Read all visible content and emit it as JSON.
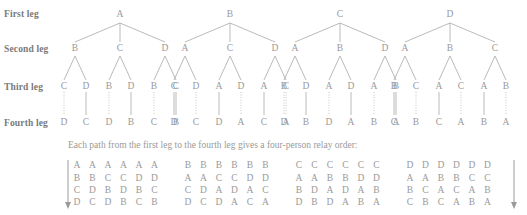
{
  "figure": {
    "row_labels": [
      "First leg",
      "Second leg",
      "Third leg",
      "Fourth leg"
    ],
    "caption": "Each path from the first leg to the fourth leg gives a four-person relay order:",
    "line_color": "#9a9a9a",
    "text_color": "#9a9a9a",
    "label_color": "#7a7a7a",
    "background": "#ffffff",
    "trees": [
      {
        "root": "A",
        "second_leg": [
          "B",
          "C",
          "D"
        ],
        "third_leg": [
          "C",
          "D",
          "B",
          "D",
          "B",
          "C"
        ],
        "fourth_leg": [
          "D",
          "C",
          "D",
          "B",
          "C",
          "B"
        ]
      },
      {
        "root": "B",
        "second_leg": [
          "A",
          "C",
          "D"
        ],
        "third_leg": [
          "C",
          "D",
          "A",
          "D",
          "A",
          "C"
        ],
        "fourth_leg": [
          "D",
          "C",
          "D",
          "A",
          "C",
          "A"
        ]
      },
      {
        "root": "C",
        "second_leg": [
          "A",
          "B",
          "D"
        ],
        "third_leg": [
          "B",
          "D",
          "A",
          "D",
          "A",
          "B"
        ],
        "fourth_leg": [
          "D",
          "B",
          "D",
          "A",
          "B",
          "A"
        ]
      },
      {
        "root": "D",
        "second_leg": [
          "A",
          "B",
          "C"
        ],
        "third_leg": [
          "B",
          "C",
          "A",
          "C",
          "A",
          "B"
        ],
        "fourth_leg": [
          "C",
          "B",
          "C",
          "A",
          "B",
          "A"
        ]
      }
    ],
    "order_blocks": [
      {
        "rows": [
          [
            "A",
            "A",
            "A",
            "A",
            "A",
            "A"
          ],
          [
            "B",
            "B",
            "C",
            "C",
            "D",
            "D"
          ],
          [
            "C",
            "D",
            "B",
            "D",
            "B",
            "C"
          ],
          [
            "D",
            "C",
            "D",
            "B",
            "C",
            "B"
          ]
        ]
      },
      {
        "rows": [
          [
            "B",
            "B",
            "B",
            "B",
            "B",
            "B"
          ],
          [
            "A",
            "A",
            "C",
            "C",
            "D",
            "D"
          ],
          [
            "C",
            "D",
            "A",
            "D",
            "A",
            "C"
          ],
          [
            "D",
            "C",
            "D",
            "A",
            "C",
            "A"
          ]
        ]
      },
      {
        "rows": [
          [
            "C",
            "C",
            "C",
            "C",
            "C",
            "C"
          ],
          [
            "A",
            "A",
            "B",
            "B",
            "D",
            "D"
          ],
          [
            "B",
            "D",
            "A",
            "D",
            "A",
            "B"
          ],
          [
            "D",
            "B",
            "D",
            "A",
            "B",
            "A"
          ]
        ]
      },
      {
        "rows": [
          [
            "D",
            "D",
            "D",
            "D",
            "D",
            "D"
          ],
          [
            "A",
            "A",
            "B",
            "B",
            "C",
            "C"
          ],
          [
            "B",
            "C",
            "A",
            "C",
            "A",
            "B"
          ],
          [
            "C",
            "B",
            "C",
            "A",
            "B",
            "A"
          ]
        ]
      }
    ],
    "arrow_markers": {
      "left": "down-arrow",
      "right": "down-arrow"
    }
  }
}
